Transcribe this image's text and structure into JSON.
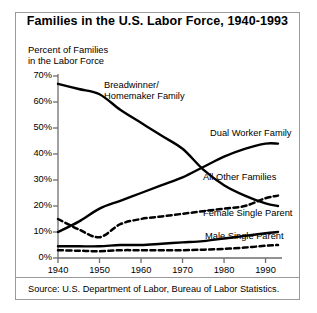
{
  "figure": {
    "title": "Families in the U.S. Labor Force, 1940-1993",
    "source": "Source: U.S. Department of Labor, Bureau of Labor Statistics.",
    "y_axis_caption": "Percent of Families\nin the Labor Force",
    "frame_color": "#9a9a9a",
    "line_color": "#000000",
    "background": "#ffffff"
  },
  "chart_data": {
    "type": "line",
    "title": "Families in the U.S. Labor Force, 1940-1993",
    "xlabel": "",
    "ylabel": "Percent of Families in the Labor Force",
    "xlim": [
      1940,
      1993
    ],
    "ylim": [
      0,
      70
    ],
    "grid": false,
    "legend_position": "inline-annotations",
    "x_ticks": [
      1940,
      1950,
      1960,
      1970,
      1980,
      1990
    ],
    "x_tick_labels": [
      "1940",
      "1950",
      "1960",
      "1970",
      "1980",
      "1990"
    ],
    "y_ticks": [
      0,
      10,
      20,
      30,
      40,
      50,
      60,
      70
    ],
    "y_tick_labels": [
      "0%",
      "10%",
      "20%",
      "30%",
      "40%",
      "50%",
      "60%",
      "70%"
    ],
    "series": [
      {
        "name": "Breadwinner/Homemaker Family",
        "label": "Breadwinner/\nHomemaker Family",
        "style": "solid",
        "x": [
          1940,
          1945,
          1950,
          1955,
          1960,
          1965,
          1970,
          1975,
          1980,
          1985,
          1990,
          1993
        ],
        "values": [
          67,
          65,
          63,
          57,
          52,
          47,
          42,
          34,
          28,
          24,
          21,
          20
        ]
      },
      {
        "name": "Dual Worker Family",
        "label": "Dual Worker Family",
        "style": "solid",
        "x": [
          1940,
          1945,
          1950,
          1955,
          1960,
          1965,
          1970,
          1975,
          1980,
          1985,
          1990,
          1993
        ],
        "values": [
          10,
          14,
          19,
          22,
          25,
          28,
          31,
          35,
          39,
          42,
          44,
          44
        ]
      },
      {
        "name": "All Other Families",
        "label": "All Other Families",
        "style": "dashed",
        "x": [
          1940,
          1945,
          1950,
          1955,
          1960,
          1965,
          1970,
          1975,
          1980,
          1985,
          1990,
          1993
        ],
        "values": [
          15,
          11,
          8,
          13,
          15,
          16,
          17,
          18,
          19,
          20,
          23,
          24
        ]
      },
      {
        "name": "Female Single Parent",
        "label": "Female Single Parent",
        "style": "solid",
        "x": [
          1940,
          1945,
          1950,
          1955,
          1960,
          1965,
          1970,
          1975,
          1980,
          1985,
          1990,
          1993
        ],
        "values": [
          4.5,
          4.5,
          4.5,
          5,
          5,
          5.5,
          6,
          6.5,
          7.5,
          8.5,
          9.5,
          10
        ]
      },
      {
        "name": "Male Single Parent",
        "label": "Male Single Parent",
        "style": "dashed",
        "x": [
          1940,
          1945,
          1950,
          1955,
          1960,
          1965,
          1970,
          1975,
          1980,
          1985,
          1990,
          1993
        ],
        "values": [
          3,
          2.8,
          2.6,
          3,
          3,
          3,
          3,
          3.2,
          3.5,
          4,
          4.7,
          5
        ]
      }
    ],
    "annotations": [
      {
        "text": "Breadwinner/\nHomemaker Family",
        "series": "Breadwinner/Homemaker Family"
      },
      {
        "text": "Dual Worker Family",
        "series": "Dual Worker Family"
      },
      {
        "text": "All Other Families",
        "series": "All Other Families"
      },
      {
        "text": "Female Single Parent",
        "series": "Female Single Parent"
      },
      {
        "text": "Male Single Parent",
        "series": "Male Single Parent"
      }
    ]
  }
}
